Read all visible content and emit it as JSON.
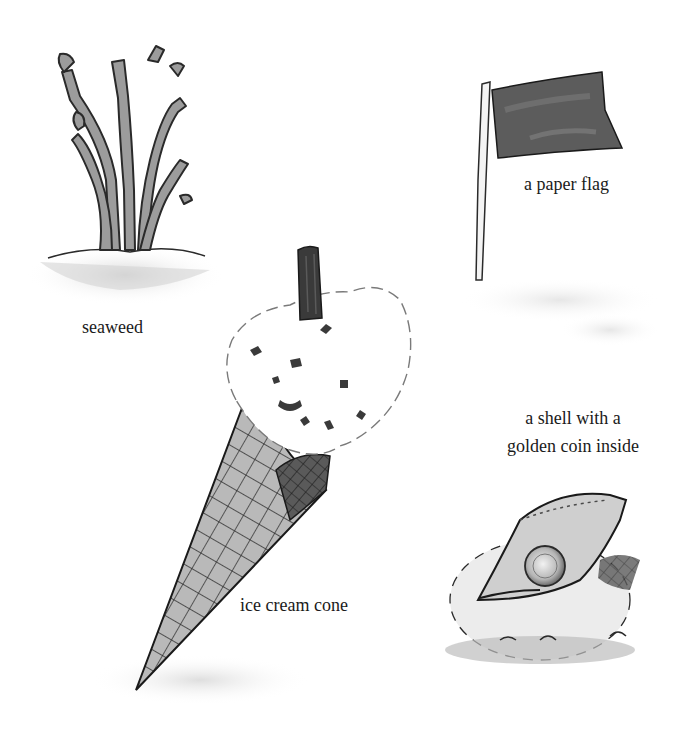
{
  "illustration": {
    "style": "grayscale pen-and-wash sketch",
    "items": [
      {
        "id": "seaweed",
        "label": "seaweed"
      },
      {
        "id": "paper-flag",
        "label": "a paper flag"
      },
      {
        "id": "shell",
        "label": "a shell with a golden coin inside"
      },
      {
        "id": "ice-cream-cone",
        "label": "ice cream cone"
      }
    ],
    "labels": {
      "seaweed": "seaweed",
      "flag": "a paper flag",
      "shell_line1": "a shell with a",
      "shell_line2": "golden coin inside",
      "cone": "ice cream cone"
    },
    "colors": {
      "background": "#ffffff",
      "ink": "#1a1a1a",
      "wash_dark": "#4a4a4a",
      "wash_mid": "#8a8a8a",
      "wash_light": "#cfcfcf"
    }
  }
}
